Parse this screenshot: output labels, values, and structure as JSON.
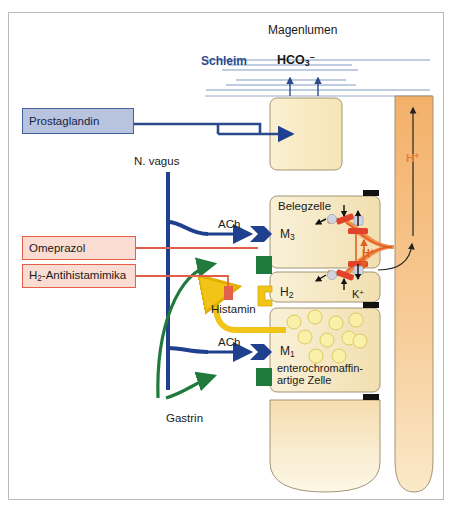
{
  "figure": {
    "type": "diagram",
    "language": "de"
  },
  "lumen": {
    "title": "Magenlumen",
    "mucus_label": "Schleim",
    "bicarbonate": {
      "base": "HCO",
      "sub": "3",
      "sup": "–"
    }
  },
  "drugs": [
    {
      "id": "prostaglandin",
      "label": "Prostaglandin",
      "style": "blue"
    },
    {
      "id": "omeprazol",
      "label": "Omeprazol",
      "style": "pink"
    },
    {
      "id": "h2-antihistaminika",
      "label": "H",
      "sub": "2",
      "label_tail": "-Antihistamimika",
      "style": "pink"
    }
  ],
  "nerve": {
    "label": "N. vagus"
  },
  "transmitters": [
    {
      "id": "ach-upper",
      "label": "ACh"
    },
    {
      "id": "ach-lower",
      "label": "ACh"
    },
    {
      "id": "histamin",
      "label": "Histamin"
    },
    {
      "id": "gastrin",
      "label": "Gastrin"
    }
  ],
  "cells": [
    {
      "id": "mucus-cell",
      "label": ""
    },
    {
      "id": "parietal-cell",
      "label": "Belegzelle"
    },
    {
      "id": "ecl-cell",
      "line1": "enterochromaffin-",
      "line2": "artige Zelle"
    }
  ],
  "receptors": [
    {
      "id": "m3",
      "base": "M",
      "sub": "3",
      "color": "#1f3f8f",
      "shape": "chevron"
    },
    {
      "id": "proton-pump",
      "base": "",
      "sub": "",
      "color": "#1f7a3c",
      "shape": "square"
    },
    {
      "id": "h2",
      "base": "H",
      "sub": "2",
      "color": "#f2c417",
      "shape": "bracket"
    },
    {
      "id": "m1",
      "base": "M",
      "sub": "1",
      "color": "#1f3f8f",
      "shape": "chevron"
    },
    {
      "id": "ecl-receptor",
      "base": "",
      "sub": "",
      "color": "#1f7a3c",
      "shape": "square"
    }
  ],
  "ions": [
    {
      "id": "h-plus-canaliculus",
      "base": "H",
      "sup": "+",
      "color": "#e2601f"
    },
    {
      "id": "k-plus",
      "base": "K",
      "sup": "+",
      "color": "#1a1a1a"
    },
    {
      "id": "h-plus-lumen",
      "base": "H",
      "sup": "+",
      "color": "#e2803a"
    }
  ],
  "colors": {
    "blue_arrow": "#1f3f8f",
    "green_arrow": "#1f7a3c",
    "yellow_arrow": "#f2c417",
    "red_line": "#e2604a",
    "cell_fill": "#f6e9c4",
    "gland_orange": "#f0a85c",
    "mucus_band": "#6f8ab8"
  }
}
